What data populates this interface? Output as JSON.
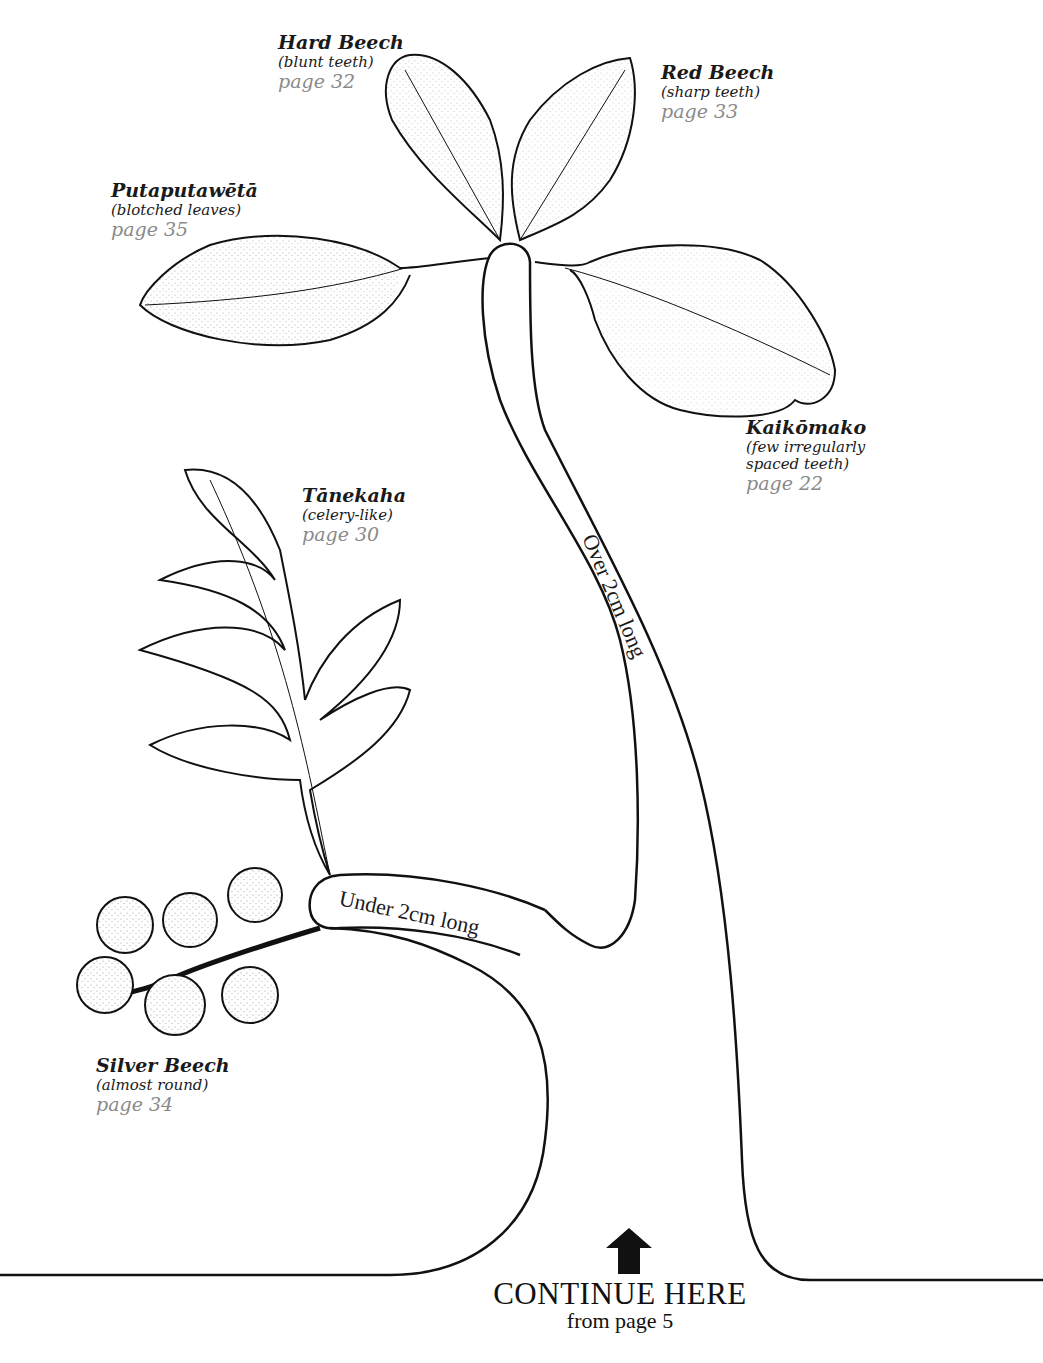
{
  "diagram": {
    "type": "dichotomous identification key (leaf tree)",
    "branches": {
      "over": "Over 2cm long",
      "under": "Under 2cm long"
    },
    "species": [
      {
        "id": "hard-beech",
        "name": "Hard Beech",
        "desc": "(blunt teeth)",
        "page": "page 32"
      },
      {
        "id": "red-beech",
        "name": "Red Beech",
        "desc": "(sharp teeth)",
        "page": "page 33"
      },
      {
        "id": "putaputaweta",
        "name": "Putaputawētā",
        "desc": "(blotched leaves)",
        "page": "page 35"
      },
      {
        "id": "kaikomako",
        "name": "Kaikōmako",
        "desc": "(few irregularly",
        "desc2": "spaced teeth)",
        "page": "page 22"
      },
      {
        "id": "tanekaha",
        "name": "Tānekaha",
        "desc": "(celery-like)",
        "page": "page 30"
      },
      {
        "id": "silver-beech",
        "name": "Silver Beech",
        "desc": "(almost round)",
        "page": "page 34"
      }
    ],
    "continue": {
      "title": "CONTINUE HERE",
      "subtitle": "from page 5",
      "icon": "up-arrow-icon"
    },
    "colors": {
      "ink": "#1a1a1a",
      "page_ref": "#8a8a8a",
      "background": "#ffffff"
    }
  }
}
